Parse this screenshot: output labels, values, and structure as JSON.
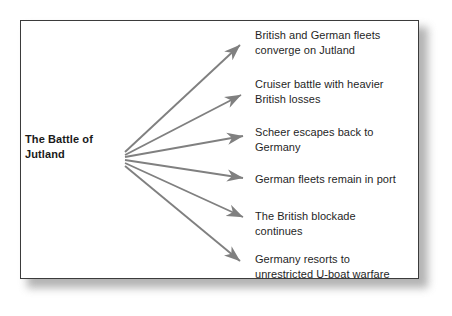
{
  "figure": {
    "root": {
      "label": "The Battle of Jutland",
      "line1": "The Battle of",
      "line2": "Jutland"
    },
    "outcomes": [
      {
        "label": "British and German fleets converge on Jutland",
        "line1": "British and German fleets",
        "line2": "converge on Jutland"
      },
      {
        "label": "Cruiser battle with heavier British losses",
        "line1": "Cruiser battle with heavier",
        "line2": "British losses"
      },
      {
        "label": "Scheer escapes back to Germany",
        "line1": "Scheer escapes back to",
        "line2": "Germany"
      },
      {
        "label": "German fleets remain in port",
        "line1": "German fleets remain in port",
        "line2": ""
      },
      {
        "label": "The British blockade continues",
        "line1": "The British blockade",
        "line2": "continues"
      },
      {
        "label": "Germany resorts to unrestricted U-boat warfare",
        "line1": "Germany resorts to",
        "line2": "unrestricted U-boat warfare"
      }
    ],
    "colors": {
      "arrow": "#808080",
      "border": "#3b3b3b",
      "text": "#1f1f1f",
      "root_text": "#1a1a1a",
      "background": "#ffffff",
      "shadow": "#9a9a9a"
    }
  }
}
